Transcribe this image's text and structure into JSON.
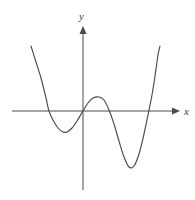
{
  "figure": {
    "width": 195,
    "height": 200,
    "background_color": "#ffffff",
    "curve_color": "#4a4a4a",
    "axis_color": "#4a4a4a",
    "label_color": "#3d3d3d"
  },
  "axes": {
    "x_label": "x",
    "y_label": "y",
    "origin_px": {
      "x": 83,
      "y": 111
    },
    "x_axis_start_px": 12,
    "x_axis_end_px": 180,
    "y_axis_top_px": 26,
    "y_axis_bottom_px": 190
  },
  "chart_data": {
    "type": "line",
    "title": "",
    "xlabel": "x",
    "ylabel": "y",
    "grid": false,
    "legend": null,
    "tick_labels": {
      "x": [],
      "y": []
    },
    "axis_arrows": {
      "x_positive": true,
      "y_positive": true
    },
    "features": {
      "degree": 4,
      "leading_coefficient_sign": "positive",
      "x_intercepts": [
        -1.7,
        0.0,
        2.3
      ],
      "local_minima": [
        {
          "x": -0.9,
          "y": -0.75
        },
        {
          "x": 1.5,
          "y": -2.2
        }
      ],
      "local_maxima": [
        {
          "x": 0.65,
          "y": 0.65
        }
      ],
      "y_intercept": 0.0
    },
    "curve_points_px": [
      {
        "x": 31,
        "y": 46
      },
      {
        "x": 36,
        "y": 62
      },
      {
        "x": 41,
        "y": 78
      },
      {
        "x": 46,
        "y": 98
      },
      {
        "x": 49,
        "y": 111
      },
      {
        "x": 53,
        "y": 120
      },
      {
        "x": 58,
        "y": 128
      },
      {
        "x": 63,
        "y": 132
      },
      {
        "x": 67,
        "y": 132
      },
      {
        "x": 72,
        "y": 128
      },
      {
        "x": 77,
        "y": 121
      },
      {
        "x": 83,
        "y": 111
      },
      {
        "x": 88,
        "y": 103
      },
      {
        "x": 93,
        "y": 98
      },
      {
        "x": 99,
        "y": 97
      },
      {
        "x": 104,
        "y": 100
      },
      {
        "x": 109,
        "y": 110
      },
      {
        "x": 114,
        "y": 124
      },
      {
        "x": 119,
        "y": 141
      },
      {
        "x": 124,
        "y": 157
      },
      {
        "x": 129,
        "y": 167
      },
      {
        "x": 134,
        "y": 166
      },
      {
        "x": 139,
        "y": 154
      },
      {
        "x": 144,
        "y": 134
      },
      {
        "x": 149,
        "y": 110
      },
      {
        "x": 152,
        "y": 95
      },
      {
        "x": 155,
        "y": 76
      },
      {
        "x": 158,
        "y": 55
      },
      {
        "x": 160,
        "y": 46
      }
    ]
  }
}
